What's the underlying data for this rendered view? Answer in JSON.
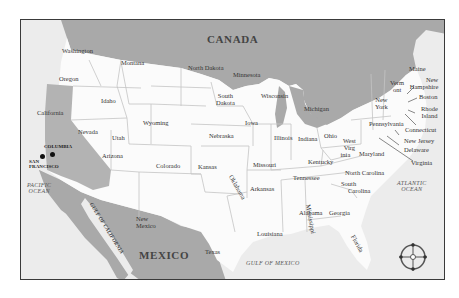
{
  "map": {
    "countries": {
      "canada": "CANADA",
      "mexico": "MEXICO"
    },
    "water": {
      "pacific": "PACIFIC OCEAN",
      "pacific_line1": "PACIFIC",
      "pacific_line2": "OCEAN",
      "atlantic_line1": "ATLANTIC",
      "atlantic_line2": "OCEAN",
      "gulf_mexico": "GULF OF MEXICO",
      "gulf_california": "GULF OF CALIFORNIA"
    },
    "cities": {
      "columbia": "COLUMBIA",
      "san_francisco_line1": "SAN",
      "san_francisco_line2": "FRANCISCO"
    },
    "states": {
      "washington": "Washington",
      "oregon": "Oregon",
      "california": "California",
      "idaho": "Idaho",
      "nevada": "Nevada",
      "montana": "Montana",
      "wyoming": "Wyoming",
      "utah": "Utah",
      "arizona": "Arizona",
      "colorado": "Colorado",
      "new_mexico_line1": "New",
      "new_mexico_line2": "Mexico",
      "north_dakota": "North Dakota",
      "south_dakota_line1": "South",
      "south_dakota_line2": "Dakota",
      "nebraska": "Nebraska",
      "kansas": "Kansas",
      "oklahoma": "Oklahoma",
      "texas": "Texas",
      "minnesota": "Minnesota",
      "iowa": "Iowa",
      "missouri": "Missouri",
      "arkansas": "Arkansas",
      "louisiana": "Louisiana",
      "wisconsin": "Wisconsin",
      "illinois": "Illinois",
      "michigan": "Michigan",
      "indiana": "Indiana",
      "ohio": "Ohio",
      "kentucky": "Kentucky",
      "tennessee": "Tennessee",
      "mississippi": "Mississippi",
      "alabama": "Alabama",
      "georgia": "Georgia",
      "florida": "Florida",
      "south_carolina_line1": "South",
      "south_carolina_line2": "Carolina",
      "north_carolina": "North Carolina",
      "virginia": "Virginia",
      "west_virginia_line1": "West",
      "west_virginia_line2": "Virg",
      "west_virginia_line3": "inia",
      "maryland": "Maryland",
      "delaware": "Delaware",
      "new_jersey": "New Jersey",
      "pennsylvania": "Pennsylvania",
      "new_york_line1": "New",
      "new_york_line2": "York",
      "connecticut": "Connecticut",
      "rhode_island_line1": "Rhode",
      "rhode_island_line2": "Island",
      "boston": "Boston",
      "new_hampshire_line1": "New",
      "new_hampshire_line2": "Hampshire",
      "vermont_line1": "Verm",
      "vermont_line2": "ont",
      "maine": "Maine"
    },
    "colors": {
      "land_foreign": "#a9a9a9",
      "land_us": "#fbfbfb",
      "water": "#ececec",
      "border": "#c4c4c4",
      "frame": "#3a3a3a",
      "california": "#b3b3b3"
    }
  }
}
